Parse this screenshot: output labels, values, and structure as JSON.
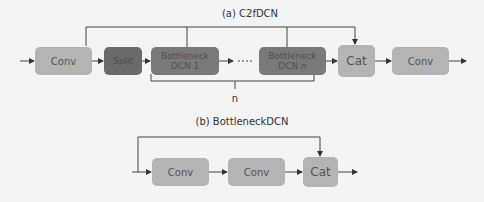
{
  "diagram_a": {
    "title": "(a) C2fDCN",
    "blocks": {
      "conv_in": "Conv",
      "split": "Split",
      "bottleneck_1": "Bottleneck DCN 1",
      "bottleneck_n": "Bottleneck DCN n",
      "cat": "Cat",
      "conv_out": "Conv"
    },
    "repeat_label": "n"
  },
  "diagram_b": {
    "title": "(b) BottleneckDCN",
    "blocks": {
      "conv_1": "Conv",
      "conv_2": "Conv",
      "cat": "Cat"
    }
  },
  "colors": {
    "background": "#f4f4f4",
    "light_block": "#b4b4b4",
    "mid_block": "#7a7a7a",
    "dark_block": "#6a6a6a",
    "line": "#333333"
  }
}
